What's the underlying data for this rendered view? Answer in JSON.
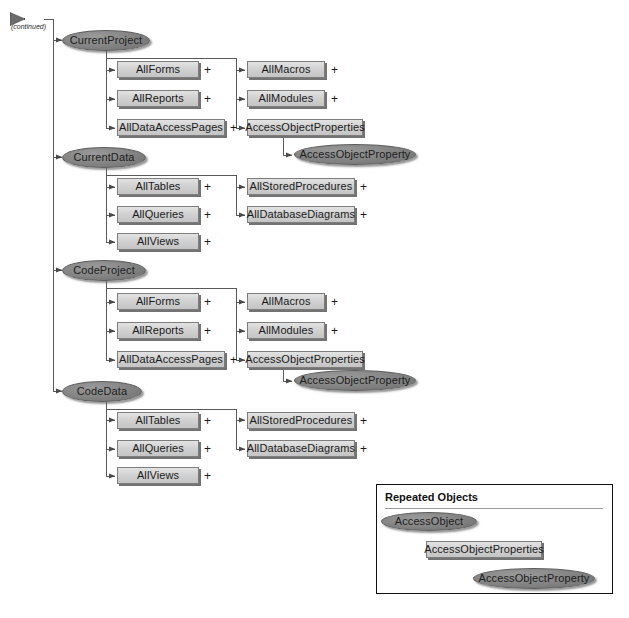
{
  "diagram": {
    "continued_label": "(continued)",
    "colors": {
      "box_fill": "#d2d2d2",
      "box_border": "#7d7d7d",
      "ellipse_fill": "#828282",
      "ellipse_border": "#5d5d5d",
      "line": "#5a5a5a",
      "text": "#1a1a1a",
      "legend_border": "#111111"
    },
    "plus_marker": "+",
    "branches": [
      {
        "root": "CurrentProject",
        "children": [
          {
            "label": "AllForms",
            "expandable": true
          },
          {
            "label": "AllReports",
            "expandable": true
          },
          {
            "label": "AllDataAccessPages",
            "expandable": true
          }
        ],
        "grandchildren": [
          {
            "label": "AllMacros",
            "expandable": true,
            "type": "box"
          },
          {
            "label": "AllModules",
            "expandable": true,
            "type": "box"
          },
          {
            "label": "AccessObjectProperties",
            "expandable": false,
            "type": "box"
          }
        ],
        "leaf": {
          "label": "AccessObjectProperty",
          "type": "ellipse"
        }
      },
      {
        "root": "CurrentData",
        "children": [
          {
            "label": "AllTables",
            "expandable": true
          },
          {
            "label": "AllQueries",
            "expandable": true
          },
          {
            "label": "AllViews",
            "expandable": true
          }
        ],
        "grandchildren": [
          {
            "label": "AllStoredProcedures",
            "expandable": true,
            "type": "box"
          },
          {
            "label": "AllDatabaseDiagrams",
            "expandable": true,
            "type": "box"
          }
        ],
        "leaf": null
      },
      {
        "root": "CodeProject",
        "children": [
          {
            "label": "AllForms",
            "expandable": true
          },
          {
            "label": "AllReports",
            "expandable": true
          },
          {
            "label": "AllDataAccessPages",
            "expandable": true
          }
        ],
        "grandchildren": [
          {
            "label": "AllMacros",
            "expandable": true,
            "type": "box"
          },
          {
            "label": "AllModules",
            "expandable": true,
            "type": "box"
          },
          {
            "label": "AccessObjectProperties",
            "expandable": false,
            "type": "box"
          }
        ],
        "leaf": {
          "label": "AccessObjectProperty",
          "type": "ellipse"
        }
      },
      {
        "root": "CodeData",
        "children": [
          {
            "label": "AllTables",
            "expandable": true
          },
          {
            "label": "AllQueries",
            "expandable": true
          },
          {
            "label": "AllViews",
            "expandable": true
          }
        ],
        "grandchildren": [
          {
            "label": "AllStoredProcedures",
            "expandable": true,
            "type": "box"
          },
          {
            "label": "AllDatabaseDiagrams",
            "expandable": true,
            "type": "box"
          }
        ],
        "leaf": null
      }
    ]
  },
  "legend": {
    "title": "Repeated Objects",
    "nodes": [
      {
        "label": "AccessObject",
        "type": "ellipse"
      },
      {
        "label": "AccessObjectProperties",
        "type": "box"
      },
      {
        "label": "AccessObjectProperty",
        "type": "ellipse"
      }
    ]
  }
}
